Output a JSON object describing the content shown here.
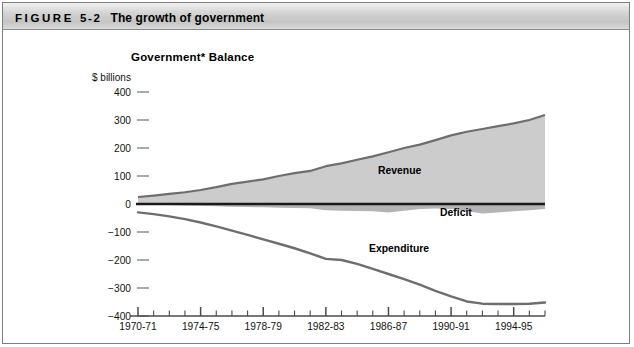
{
  "header": {
    "figure_word": "FIGURE",
    "figure_number": "5-2",
    "title": "The growth of government"
  },
  "chart_title": "Government* Balance",
  "y_axis_caption": "$ billions",
  "labels": {
    "revenue": "Revenue",
    "deficit": "Deficit",
    "expenditure": "Expenditure"
  },
  "chart_data": {
    "type": "area",
    "title": "Government* Balance",
    "xlabel": "",
    "ylabel": "$ billions",
    "ylim": [
      -400,
      400
    ],
    "ytick_labels": [
      "400",
      "300",
      "200",
      "100",
      "0",
      "-100",
      "-200",
      "-300",
      "-400"
    ],
    "ytick_values": [
      400,
      300,
      200,
      100,
      0,
      -100,
      -200,
      -300,
      -400
    ],
    "grid": false,
    "legend": "inline-annotations",
    "x": [
      "1970-71",
      "1971-72",
      "1972-73",
      "1973-74",
      "1974-75",
      "1975-76",
      "1976-77",
      "1977-78",
      "1978-79",
      "1979-80",
      "1980-81",
      "1981-82",
      "1982-83",
      "1983-84",
      "1984-85",
      "1985-86",
      "1986-87",
      "1987-88",
      "1988-89",
      "1989-90",
      "1990-91",
      "1991-92",
      "1992-93",
      "1993-94",
      "1994-95",
      "1995-96",
      "1996-97"
    ],
    "xtick_labels": [
      "1970-71",
      "1974-75",
      "1978-79",
      "1982-83",
      "1986-87",
      "1990-91",
      "1994-95"
    ],
    "series": [
      {
        "name": "Revenue",
        "values": [
          25,
          30,
          36,
          42,
          50,
          60,
          72,
          80,
          88,
          100,
          110,
          118,
          135,
          145,
          158,
          170,
          185,
          200,
          212,
          228,
          245,
          258,
          268,
          278,
          288,
          300,
          318
        ]
      },
      {
        "name": "Deficit",
        "values": [
          -2,
          -3,
          -4,
          -5,
          -6,
          -8,
          -10,
          -11,
          -12,
          -13,
          -14,
          -15,
          -22,
          -24,
          -25,
          -26,
          -30,
          -24,
          -18,
          -16,
          -18,
          -26,
          -34,
          -30,
          -26,
          -22,
          -18
        ]
      },
      {
        "name": "Expenditure",
        "values": [
          -30,
          -36,
          -44,
          -54,
          -66,
          -80,
          -95,
          -110,
          -126,
          -142,
          -158,
          -176,
          -196,
          -200,
          -214,
          -232,
          -250,
          -268,
          -288,
          -310,
          -330,
          -348,
          -356,
          -357,
          -357,
          -356,
          -352
        ]
      }
    ]
  },
  "colors": {
    "area_fill": "#cccccc",
    "line_stroke": "#6e6e6e",
    "axis": "#1a1a1a",
    "header_text": "#000000"
  }
}
